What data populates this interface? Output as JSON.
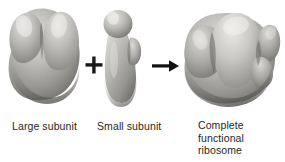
{
  "figure": {
    "background_color": "#ffffff",
    "text_color": "#231f20",
    "shape_fill_light": "#d8d8d6",
    "shape_fill_mid": "#9a9a97",
    "shape_fill_dark": "#5f5f5d",
    "operator_color": "#1a1a1a"
  },
  "items": [
    {
      "id": "large-subunit",
      "caption": "Large subunit",
      "shape_name": "large-ribosomal-subunit-blob"
    },
    {
      "id": "small-subunit",
      "caption": "Small subunit",
      "shape_name": "small-ribosomal-subunit-blob"
    },
    {
      "id": "complete-ribosome",
      "caption": "Complete\nfunctional\nribosome",
      "shape_name": "complete-ribosome-blob"
    }
  ],
  "operators": [
    {
      "id": "plus",
      "symbol": "+",
      "name": "plus-sign"
    },
    {
      "id": "arrow",
      "symbol": "→",
      "name": "right-arrow"
    }
  ]
}
